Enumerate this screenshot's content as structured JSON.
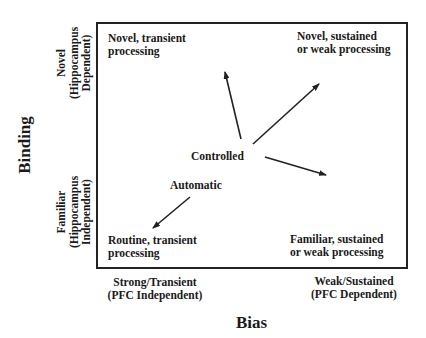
{
  "diagram": {
    "y_axis": {
      "title": "Binding",
      "top_label": [
        "Novel",
        "(Hippocampus",
        "Dependent)"
      ],
      "bottom_label": [
        "Familiar",
        "(Hippocampus",
        "Independent)"
      ]
    },
    "x_axis": {
      "title": "Bias",
      "left_label": [
        "Strong/Transient",
        "(PFC Independent)"
      ],
      "right_label": [
        "Weak/Sustained",
        "(PFC Dependent)"
      ]
    },
    "quadrants": {
      "top_left": [
        "Novel, transient",
        "processing"
      ],
      "top_right": [
        "Novel, sustained",
        "or weak processing"
      ],
      "bottom_left": [
        "Routine, transient",
        "processing"
      ],
      "bottom_right": [
        "Familiar, sustained",
        "or weak processing"
      ]
    },
    "nodes": {
      "controlled": "Controlled",
      "automatic": "Automatic"
    },
    "arrows": [
      {
        "from": "Controlled",
        "to": "Novel, transient processing"
      },
      {
        "from": "Controlled",
        "to": "Novel, sustained or weak processing"
      },
      {
        "from": "Controlled",
        "to": "Familiar, sustained or weak processing"
      },
      {
        "from": "Automatic",
        "to": "Routine, transient processing"
      }
    ],
    "colors": {
      "line": "#222222",
      "text": "#1a1a1a",
      "background": "#ffffff"
    }
  }
}
